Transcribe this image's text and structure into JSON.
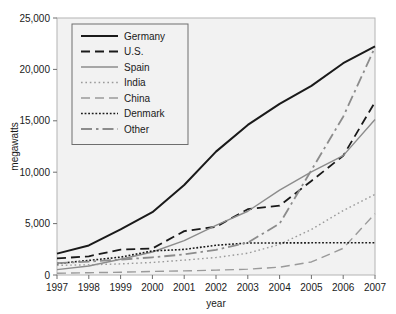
{
  "chart_data": {
    "type": "line",
    "title": "",
    "xlabel": "year",
    "ylabel": "megawatts",
    "x": [
      1997,
      1998,
      1999,
      2000,
      2001,
      2002,
      2003,
      2004,
      2005,
      2006,
      2007
    ],
    "xlim": [
      1997,
      2007
    ],
    "ylim": [
      0,
      25000
    ],
    "ytick_labels": [
      "0",
      "5,000",
      "10,000",
      "15,000",
      "20,000",
      "25,000"
    ],
    "yticks": [
      0,
      5000,
      10000,
      15000,
      20000,
      25000
    ],
    "xtick_labels": [
      "1997",
      "1998",
      "1999",
      "2000",
      "2001",
      "2002",
      "2003",
      "2004",
      "2005",
      "2006",
      "2007"
    ],
    "grid": false,
    "legend_position": "top-left",
    "series": [
      {
        "name": "Germany",
        "style": "solid",
        "color": "#1a1a1a",
        "width": 2.0,
        "values": [
          2080,
          2875,
          4445,
          6110,
          8750,
          12000,
          14600,
          16650,
          18400,
          20600,
          22250
        ]
      },
      {
        "name": "U.S.",
        "style": "dashed",
        "color": "#1a1a1a",
        "width": 1.8,
        "values": [
          1610,
          1820,
          2470,
          2580,
          4270,
          4690,
          6400,
          6740,
          9150,
          11600,
          16820
        ]
      },
      {
        "name": "Spain",
        "style": "solid",
        "color": "#8c8c8c",
        "width": 1.4,
        "values": [
          520,
          880,
          1530,
          2240,
          3340,
          4830,
          6200,
          8260,
          10030,
          11610,
          15130
        ]
      },
      {
        "name": "India",
        "style": "dotted",
        "color": "#9a9a9a",
        "width": 1.4,
        "values": [
          940,
          990,
          1080,
          1220,
          1450,
          1700,
          2120,
          2980,
          4430,
          6270,
          7850
        ]
      },
      {
        "name": "China",
        "style": "dashed",
        "color": "#9a9a9a",
        "width": 1.4,
        "values": [
          170,
          220,
          270,
          350,
          400,
          470,
          570,
          760,
          1270,
          2600,
          5970
        ]
      },
      {
        "name": "Denmark",
        "style": "densely-dotted",
        "color": "#1a1a1a",
        "width": 1.6,
        "values": [
          1110,
          1420,
          1740,
          2340,
          2490,
          2890,
          3110,
          3120,
          3130,
          3140,
          3130
        ]
      },
      {
        "name": "Other",
        "style": "dash-dot",
        "color": "#8c8c8c",
        "width": 1.8,
        "values": [
          1150,
          1300,
          1500,
          1720,
          2000,
          2450,
          3150,
          5000,
          10200,
          15400,
          22150
        ]
      }
    ]
  },
  "legend": {
    "items": [
      {
        "label": "Germany"
      },
      {
        "label": "U.S."
      },
      {
        "label": "Spain"
      },
      {
        "label": "India"
      },
      {
        "label": "China"
      },
      {
        "label": "Denmark"
      },
      {
        "label": "Other"
      }
    ]
  }
}
